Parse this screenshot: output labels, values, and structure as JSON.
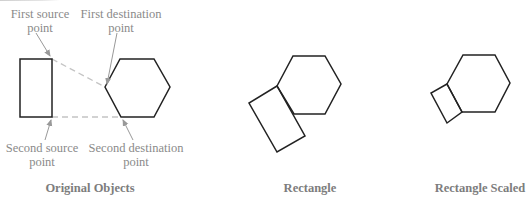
{
  "colors": {
    "shape_stroke": "#222222",
    "guide_dash": "#c4c4c4",
    "arrow": "#999999",
    "label_text": "#8a8a8a",
    "caption_text": "#7d7d7d"
  },
  "panels": [
    {
      "id": "original",
      "caption": "Original Objects",
      "labels": {
        "first_source": [
          "First source",
          "point"
        ],
        "first_destination": [
          "First destination",
          "point"
        ],
        "second_source": [
          "Second source",
          "point"
        ],
        "second_destination": [
          "Second destination",
          "point"
        ]
      }
    },
    {
      "id": "rectangle",
      "caption": "Rectangle"
    },
    {
      "id": "rectangle-scaled",
      "caption": "Rectangle Scaled"
    }
  ]
}
